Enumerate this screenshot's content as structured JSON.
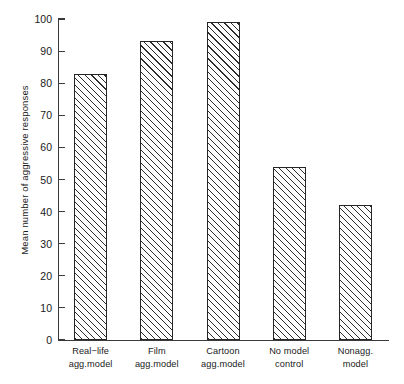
{
  "chart_data": {
    "type": "bar",
    "title": "",
    "xlabel": "",
    "ylabel": "Mean number of aggressive responses",
    "categories": [
      "Real-life\nagg. model",
      "Film\nagg. model",
      "Cartoon\nagg. model",
      "No model\ncontrol",
      "Nonagg.\nmodel"
    ],
    "category_lines": [
      [
        "Real−life",
        "agg.model"
      ],
      [
        "Film",
        "agg.model"
      ],
      [
        "Cartoon",
        "agg.model"
      ],
      [
        "No model",
        "control"
      ],
      [
        "Nonagg.",
        "model"
      ]
    ],
    "values": [
      83,
      93,
      99,
      54,
      42
    ],
    "ylim": [
      0,
      100
    ],
    "yticks": [
      0,
      10,
      20,
      30,
      40,
      50,
      60,
      70,
      80,
      90,
      100
    ],
    "ytick_labels": [
      "0",
      "10",
      "20",
      "30",
      "40",
      "50",
      "60",
      "70",
      "80",
      "90",
      "100"
    ],
    "grid": false,
    "legend": null,
    "bar_style": {
      "fill": "#fdfdfd",
      "edge": "#262626",
      "hatch": "diagonal-45"
    }
  },
  "axis": {
    "line_color": "#3a3a3a"
  }
}
